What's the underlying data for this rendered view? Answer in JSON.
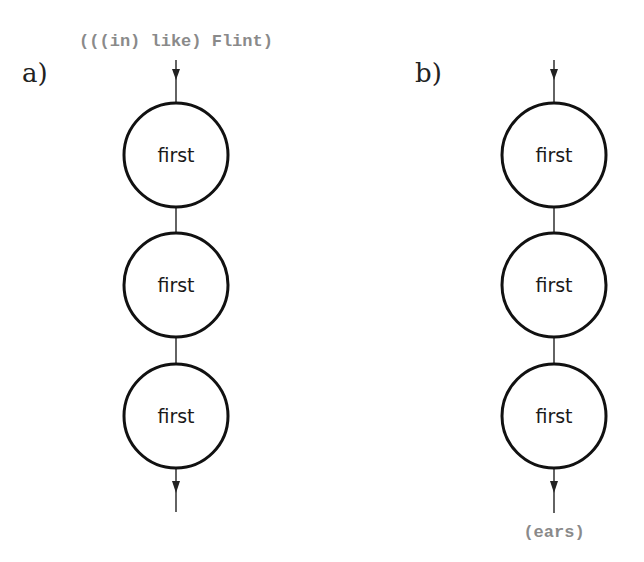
{
  "panels": [
    {
      "label": "a)",
      "input": "(((in) like) Flint)",
      "output": "",
      "nodes": [
        {
          "label": "first"
        },
        {
          "label": "first"
        },
        {
          "label": "first"
        }
      ]
    },
    {
      "label": "b)",
      "input": "",
      "output": "(ears)",
      "nodes": [
        {
          "label": "first"
        },
        {
          "label": "first"
        },
        {
          "label": "first"
        }
      ]
    }
  ]
}
